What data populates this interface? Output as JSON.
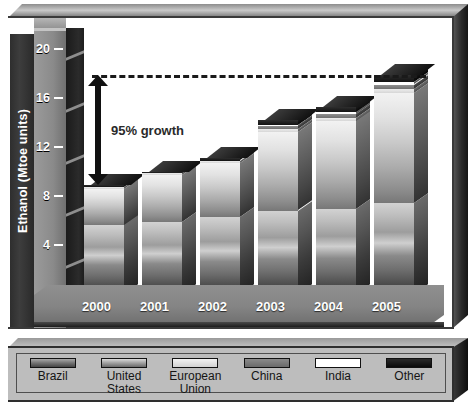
{
  "chart_data": {
    "type": "bar",
    "subtype": "stacked-3d-column",
    "title": "",
    "xlabel": "",
    "ylabel": "Ethanol (Mtoe units)",
    "ylim": [
      0,
      20
    ],
    "ytick_labels": [
      "0",
      "4",
      "8",
      "12",
      "16",
      "20"
    ],
    "ytick_values": [
      0,
      4,
      8,
      12,
      16,
      20
    ],
    "grid": false,
    "legend_position": "bottom",
    "categories": [
      "2000",
      "2001",
      "2002",
      "2003",
      "2004",
      "2005"
    ],
    "series": [
      {
        "name": "Brazil",
        "values": [
          5.6,
          5.9,
          6.3,
          6.8,
          6.9,
          7.4
        ]
      },
      {
        "name": "United States",
        "values": [
          3.0,
          3.8,
          4.4,
          6.4,
          7.2,
          9.0
        ]
      },
      {
        "name": "European Union",
        "values": [
          0.15,
          0.15,
          0.2,
          0.25,
          0.3,
          0.35
        ]
      },
      {
        "name": "China",
        "values": [
          0.0,
          0.0,
          0.0,
          0.25,
          0.3,
          0.35
        ]
      },
      {
        "name": "India",
        "values": [
          0.0,
          0.0,
          0.0,
          0.1,
          0.15,
          0.2
        ]
      },
      {
        "name": "Other",
        "values": [
          0.15,
          0.15,
          0.2,
          0.4,
          0.45,
          0.6
        ]
      }
    ],
    "totals": [
      8.9,
      10.0,
      11.1,
      14.2,
      15.3,
      17.9
    ],
    "annotations": [
      {
        "type": "reference-line",
        "style": "dashed",
        "value": 17.9,
        "label": ""
      },
      {
        "type": "double-arrow",
        "from": 8.9,
        "to": 17.9,
        "label": "95% growth"
      }
    ]
  },
  "axis": {
    "title": "Ethanol (Mtoe units)",
    "ticks": [
      {
        "label": "20",
        "value": 20
      },
      {
        "label": "16",
        "value": 16
      },
      {
        "label": "12",
        "value": 12
      },
      {
        "label": "8",
        "value": 8
      },
      {
        "label": "4",
        "value": 4
      },
      {
        "label": "0",
        "value": 0
      }
    ]
  },
  "xaxis": {
    "labels": [
      "2000",
      "2001",
      "2002",
      "2003",
      "2004",
      "2005"
    ]
  },
  "annotation": {
    "growth_label": "95% growth"
  },
  "legend": {
    "items": [
      {
        "label": "Brazil",
        "label_line1": "Brazil",
        "label_line2": "",
        "color": "#6e6e6e"
      },
      {
        "label": "United States",
        "label_line1": "United",
        "label_line2": "States",
        "color": "#9a9a9a"
      },
      {
        "label": "European Union",
        "label_line1": "European",
        "label_line2": "Union",
        "color": "#e2e2e2"
      },
      {
        "label": "China",
        "label_line1": "China",
        "label_line2": "",
        "color": "#7a7a7a"
      },
      {
        "label": "India",
        "label_line1": "India",
        "label_line2": "",
        "color": "#ffffff"
      },
      {
        "label": "Other",
        "label_line1": "Other",
        "label_line2": "",
        "color": "#141414"
      }
    ]
  }
}
